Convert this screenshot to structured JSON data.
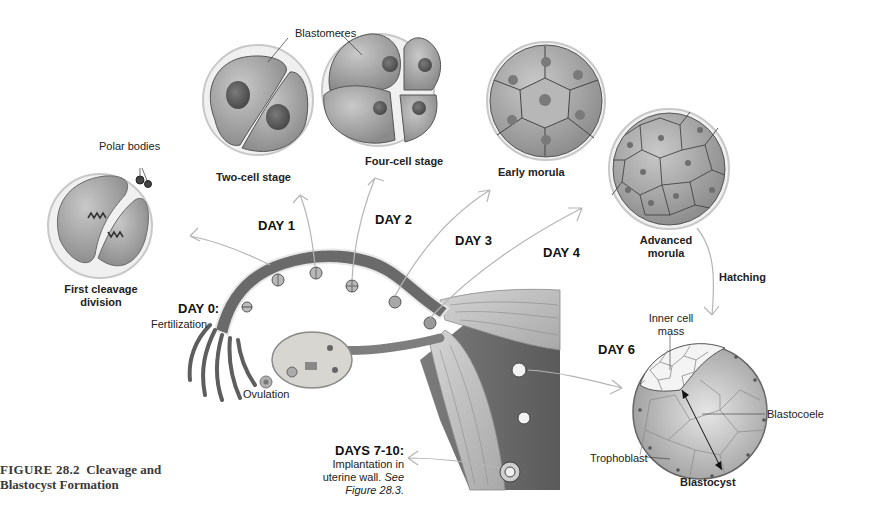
{
  "figure": {
    "number_label": "FIGURE 28.2",
    "title_line1": "Cleavage and",
    "title_line2": "Blastocyst Formation"
  },
  "stages": {
    "first_cleavage": {
      "line1": "First cleavage",
      "line2": "division"
    },
    "polar_bodies": "Polar bodies",
    "two_cell": "Two-cell stage",
    "blastomeres": "Blastomeres",
    "four_cell": "Four-cell stage",
    "early_morula": "Early morula",
    "advanced_morula": {
      "line1": "Advanced",
      "line2": "morula"
    },
    "hatching": "Hatching",
    "blastocyst": "Blastocyst",
    "inner_cell_mass": {
      "line1": "Inner cell",
      "line2": "mass"
    },
    "blastocoele": "Blastocoele",
    "trophoblast": "Trophoblast"
  },
  "days": {
    "day0": {
      "label": "DAY 0:",
      "desc": "Fertilization"
    },
    "day1": "DAY 1",
    "day2": "DAY 2",
    "day3": "DAY 3",
    "day4": "DAY 4",
    "day6": "DAY 6",
    "days7_10": {
      "label": "DAYS 7-10:",
      "line1": "Implantation in",
      "line2": "uterine wall.",
      "line2_italic": "See",
      "line3": "Figure 28.3."
    }
  },
  "ovulation": "Ovulation",
  "colors": {
    "cell_fill": "#9a9a9a",
    "cell_light": "#c8c8c8",
    "nucleus": "#5e5e5e",
    "zona": "#e2e2e2",
    "tube": "#6e6e6e",
    "arrow_outline": "#b5b5b5",
    "caption": "#3a3a3a"
  }
}
